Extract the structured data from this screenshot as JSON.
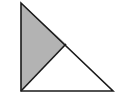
{
  "diagram": {
    "type": "right-triangle-partition",
    "background": "#ffffff",
    "stroke_color": "#1a1a1a",
    "stroke_width": 1.6,
    "vertices": {
      "top": [
        21,
        3
      ],
      "bottom_left": [
        21,
        91
      ],
      "bottom_right": [
        113,
        91
      ]
    },
    "divider_point_on_hypotenuse": [
      66,
      44
    ],
    "regions": [
      {
        "name": "shaded-left-triangle",
        "fill": "#b3b3b3"
      },
      {
        "name": "unshaded-right-triangle",
        "fill": "#ffffff"
      }
    ]
  }
}
